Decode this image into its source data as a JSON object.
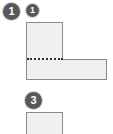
{
  "figure": {
    "background_color": "#ffffff",
    "shape_fill_color": "#f0f0f0",
    "shape_stroke_color": "#8a8a8a",
    "division_line_color": "#2f2f2f",
    "badge_background_color": "#58585a",
    "badge_text_color": "#ffffff"
  },
  "badges": [
    {
      "id": "step-1",
      "label": "1",
      "size": "large"
    },
    {
      "id": "label-1",
      "label": "1",
      "size": "medium"
    },
    {
      "id": "step-3",
      "label": "3",
      "size": "large"
    }
  ],
  "shapes": {
    "l_shape": {
      "name": "l-shape",
      "vertical_arm": {
        "x": 26,
        "y": 22,
        "width": 37,
        "height": 58
      },
      "horizontal_arm": {
        "x": 26,
        "y": 59,
        "width": 81,
        "height": 21
      },
      "division_line": {
        "style": "dotted",
        "orientation": "horizontal",
        "x": 27,
        "y": 58,
        "length": 36
      }
    },
    "lower_rect": {
      "name": "lower-rectangle",
      "x": 26,
      "y": 112,
      "width": 37,
      "height": 26
    }
  }
}
